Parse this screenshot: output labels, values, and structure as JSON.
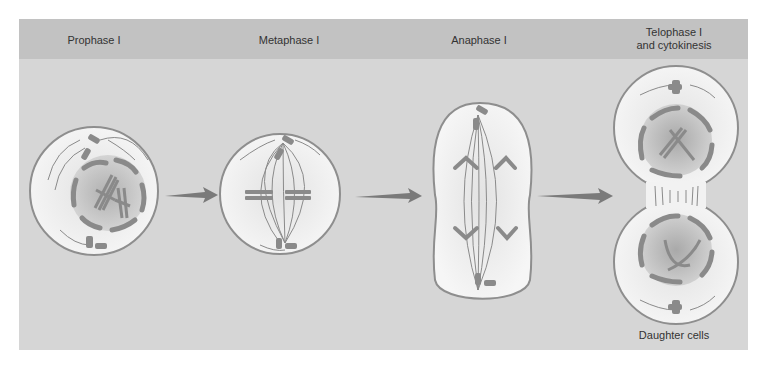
{
  "figure": {
    "stages": [
      {
        "label": "Prophase I"
      },
      {
        "label": "Metaphase I"
      },
      {
        "label": "Anaphase I"
      },
      {
        "label": "Telophase I\nand cytokinesis"
      }
    ],
    "footer_label": "Daughter cells"
  },
  "colors": {
    "panel_bg": "#d6d6d6",
    "header_bg": "#c2c2c2",
    "cell_fill": "#f2f2f2",
    "cell_outline": "#8a8a8a",
    "chromosome": "#8c8c8c",
    "nucleus": "#a9a9a9",
    "arrow": "#7a7a7a"
  }
}
